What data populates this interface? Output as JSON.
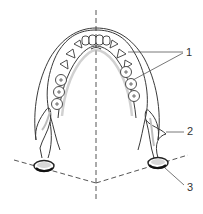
{
  "diagram": {
    "labels": [
      {
        "id": "1",
        "text": "1",
        "x": 185,
        "y": 47
      },
      {
        "id": "2",
        "text": "2",
        "x": 187,
        "y": 126
      },
      {
        "id": "3",
        "text": "3",
        "x": 187,
        "y": 182
      }
    ],
    "colors": {
      "stroke": "#3a3a3a",
      "shade": "#bdbdbd",
      "dash": "#555555",
      "background": "#ffffff"
    }
  }
}
